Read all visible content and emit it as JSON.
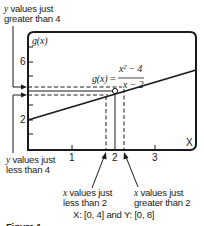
{
  "annotations": {
    "top_left_line1_var": "y",
    "top_left_line1_rest": " values just",
    "top_left_line2": "greater than 4",
    "bottom_left_line1_var": "y",
    "bottom_left_line1_rest": " values just",
    "bottom_left_line2": "less than 4",
    "bottom_mid_line1_var": "x",
    "bottom_mid_line1_rest": " values just",
    "bottom_mid_line2": "less than 2",
    "bottom_right_line1_var": "x",
    "bottom_right_line1_rest": " values just",
    "bottom_right_line2": "greater than 2"
  },
  "graph": {
    "y_axis_label": "g(x)",
    "x_axis_label": "X",
    "function_lhs": "g(x) =",
    "function_numerator": "x² − 4",
    "function_denominator": "x − 2",
    "y_ticks": [
      "6",
      "2"
    ],
    "x_ticks": [
      "1",
      "2",
      "3"
    ],
    "hole_point": {
      "x": 2,
      "y": 4
    },
    "line_color": "#1a1a1a"
  },
  "window": {
    "text": "X: [0, 4] and Y: [0, 8]"
  },
  "caption": {
    "text": "Figure 1"
  }
}
